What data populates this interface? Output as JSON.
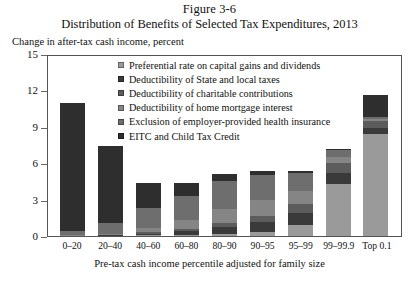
{
  "figure": {
    "number": "Figure 3-6",
    "title": "Distribution of Benefits of Selected Tax Expenditures, 2013",
    "ylabel": "Change in after-tax cash income, percent",
    "xlabel": "Pre-tax cash income percentile adjusted for family size"
  },
  "chart_data": {
    "type": "bar",
    "stacked": true,
    "title": "Distribution of Benefits of Selected Tax Expenditures, 2013",
    "subtitle": "Figure 3-6",
    "xlabel": "Pre-tax cash income percentile adjusted for family size",
    "ylabel": "Change in after-tax cash income, percent",
    "ylim": [
      0,
      15
    ],
    "yticks": [
      0,
      3,
      6,
      9,
      12,
      15
    ],
    "ytick_labels": [
      "0",
      "3",
      "6",
      "9",
      "12",
      "15"
    ],
    "grid": false,
    "legend_position": "inside-upper-center",
    "categories": [
      "0–20",
      "20–40",
      "40–60",
      "60–80",
      "80–90",
      "90–95",
      "95–99",
      "99–99.9",
      "Top 0.1"
    ],
    "series": [
      {
        "name": "Preferential rate on capital gains and dividends",
        "color": "#9a9a9a",
        "values": [
          0.0,
          0.0,
          0.05,
          0.1,
          0.2,
          0.35,
          0.9,
          4.3,
          8.4
        ]
      },
      {
        "name": "Deductibility of State and local taxes",
        "color": "#3a3a3a",
        "values": [
          0.0,
          0.05,
          0.15,
          0.3,
          0.55,
          0.8,
          1.0,
          0.9,
          0.5
        ]
      },
      {
        "name": "Deductibility of charitable contributions",
        "color": "#5c5c5c",
        "values": [
          0.0,
          0.05,
          0.1,
          0.2,
          0.35,
          0.5,
          0.7,
          0.8,
          0.6
        ]
      },
      {
        "name": "Deductibility of home mortgage interest",
        "color": "#858585",
        "values": [
          0.05,
          0.1,
          0.4,
          0.7,
          1.1,
          1.3,
          1.1,
          0.5,
          0.15
        ]
      },
      {
        "name": "Exclusion of employer-provided health insurance",
        "color": "#6e6e6e",
        "values": [
          0.35,
          0.9,
          1.6,
          2.0,
          2.3,
          2.1,
          1.5,
          0.6,
          0.15
        ]
      },
      {
        "name": "EITC and Child Tax Credit",
        "color": "#2e2e2e",
        "values": [
          10.6,
          6.3,
          2.1,
          1.1,
          0.6,
          0.35,
          0.2,
          0.05,
          1.8
        ]
      }
    ],
    "totals": [
      11.0,
      7.4,
      4.4,
      4.4,
      5.1,
      5.4,
      5.4,
      7.15,
      11.6
    ]
  }
}
